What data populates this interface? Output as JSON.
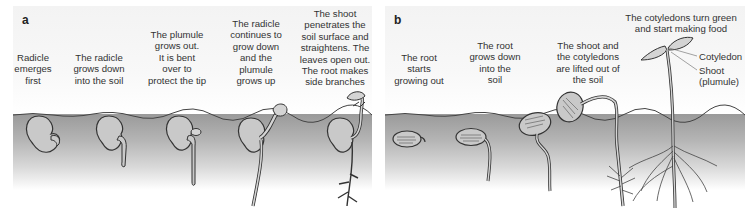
{
  "figure": {
    "panel_a": {
      "label": "a",
      "stages": [
        {
          "caption": [
            "Radicle",
            "emerges",
            "first"
          ]
        },
        {
          "caption": [
            "The radicle",
            "grows down",
            "into the soil"
          ]
        },
        {
          "caption": [
            "The plumule",
            "grows out.",
            "It is bent",
            "over to",
            "protect the tip"
          ]
        },
        {
          "caption": [
            "The radicle",
            "continues to",
            "grow down",
            "and the",
            "plumule",
            "grows up"
          ]
        },
        {
          "caption": [
            "The shoot",
            "penetrates the",
            "soil surface and",
            "straightens. The",
            "leaves open out.",
            "The root makes",
            "side branches"
          ]
        }
      ]
    },
    "panel_b": {
      "label": "b",
      "stages": [
        {
          "caption": [
            "The root",
            "starts",
            "growing out"
          ]
        },
        {
          "caption": [
            "The root",
            "grows down",
            "into the",
            "soil"
          ]
        },
        {
          "caption": [
            "The shoot and",
            "the cotyledons",
            "are lifted out of",
            "the soil"
          ]
        },
        {
          "caption": [
            "The cotyledons turn green",
            "and start making food"
          ]
        }
      ],
      "labels": {
        "cotyledon": "Cotyledon",
        "shoot": [
          "Shoot",
          "(plumule)"
        ]
      }
    },
    "colors": {
      "soil_top": "#9a9a9a",
      "soil_bottom": "#ffffff",
      "sky": "#f3f3f3",
      "seed_fill": "#c8c8c8",
      "outline": "#333333"
    }
  }
}
